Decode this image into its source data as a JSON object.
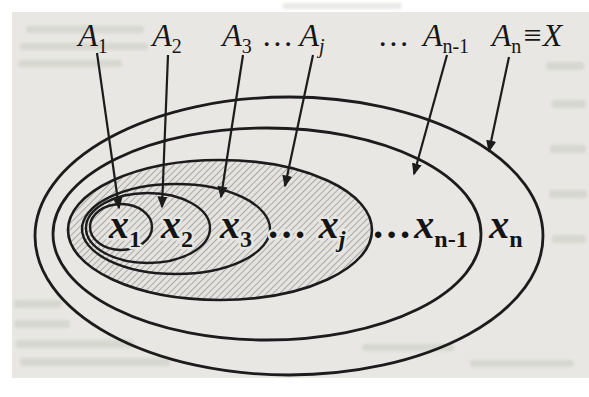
{
  "figure": {
    "type": "nested-sets-diagram",
    "description_visible_text_only": true,
    "top_labels": [
      {
        "base": "A",
        "sub": "1"
      },
      {
        "base": "A",
        "sub": "2"
      },
      {
        "base": "A",
        "sub": "3"
      },
      {
        "dots": "…"
      },
      {
        "base": "A",
        "sub": "j"
      },
      {
        "dots": "…"
      },
      {
        "base": "A",
        "sub": "n-1"
      },
      {
        "base": "A",
        "sub": "n",
        "suffix": "≡X"
      }
    ],
    "element_labels": [
      {
        "base": "x",
        "sub": "1"
      },
      {
        "base": "x",
        "sub": "2"
      },
      {
        "base": "x",
        "sub": "3"
      },
      {
        "dots": "…"
      },
      {
        "base": "x",
        "sub": "j"
      },
      {
        "dots": "…"
      },
      {
        "base": "x",
        "sub": "n-1"
      },
      {
        "base": "x",
        "sub": "n"
      }
    ]
  },
  "colors": {
    "ink": "#1c1c1c",
    "paper": "#e8e7e3",
    "hatch_line": "#8d8c87",
    "hatch_background": "#e4e3df",
    "page_margin": "#ffffff"
  }
}
